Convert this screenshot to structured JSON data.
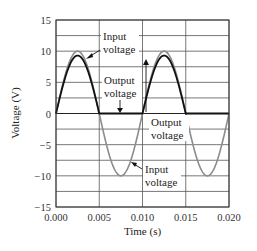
{
  "chart_data": {
    "type": "line",
    "title": "",
    "xlabel": "Time (s)",
    "ylabel": "Voltage (V)",
    "xlim": [
      0.0,
      0.02
    ],
    "ylim": [
      -15,
      15
    ],
    "grid": true,
    "x_ticks": [
      "0.000",
      "0.005",
      "0.010",
      "0.015",
      "0.020"
    ],
    "y_ticks": [
      "15",
      "10",
      "5",
      "0",
      "−5",
      "−10",
      "−15"
    ],
    "series": [
      {
        "name": "Input voltage",
        "color": "#8c8c8c",
        "description": "10 V peak, 100 Hz sine wave",
        "amplitude": 10,
        "frequency_hz": 100,
        "x": [
          0.0,
          0.0025,
          0.005,
          0.0075,
          0.01,
          0.0125,
          0.015,
          0.0175,
          0.02
        ],
        "values": [
          0,
          10,
          0,
          -10,
          0,
          10,
          0,
          -10,
          0
        ]
      },
      {
        "name": "Output voltage",
        "color": "#111111",
        "description": "Half-wave rectified output, peak about 9.3 V, zero during negative half-cycles",
        "peak": 9.3,
        "x": [
          0.0,
          0.0025,
          0.005,
          0.0075,
          0.01,
          0.0125,
          0.015,
          0.0175,
          0.02
        ],
        "values": [
          0,
          9.3,
          0,
          0,
          0,
          9.3,
          0,
          0,
          0
        ]
      }
    ],
    "annotations": [
      {
        "text": [
          "Input",
          "voltage"
        ],
        "points_to": "input peak near t=0.002"
      },
      {
        "text": [
          "Output",
          "voltage"
        ],
        "points_to": "output at zero near t=0.0075"
      },
      {
        "text": [
          "Output",
          "voltage"
        ],
        "points_to": "output peak near t=0.0125"
      },
      {
        "text": [
          "Input",
          "voltage"
        ],
        "points_to": "input trough near t=0.008"
      }
    ]
  },
  "labels": {
    "input_top_1": "Input",
    "input_top_2": "voltage",
    "output_mid_1": "Output",
    "output_mid_2": "voltage",
    "output_right_1": "Output",
    "output_right_2": "voltage",
    "input_bottom_1": "Input",
    "input_bottom_2": "voltage"
  }
}
